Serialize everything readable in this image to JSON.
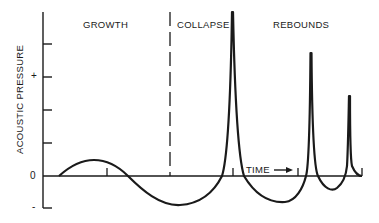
{
  "diagram": {
    "y_axis_label": "ACOUSTIC PRESSURE",
    "y_symbols": {
      "plus": "+",
      "zero": "0",
      "minus": "-"
    },
    "phases": [
      {
        "label": "GROWTH"
      },
      {
        "label": "COLLAPSE"
      },
      {
        "label": "REBOUNDS"
      }
    ],
    "x_axis_label": "TIME",
    "x_axis_arrow": "→",
    "colors": {
      "line": "#1a1a1a",
      "background": "#ffffff"
    }
  }
}
